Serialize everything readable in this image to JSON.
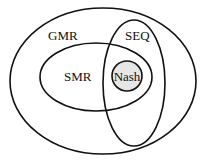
{
  "diagram": {
    "type": "venn",
    "sets": {
      "gmr": {
        "label": "GMR",
        "cx": 103,
        "cy": 81,
        "rx": 93,
        "ry": 73
      },
      "smr": {
        "label": "SMR",
        "cx": 96,
        "cy": 77,
        "rx": 56,
        "ry": 34
      },
      "seq": {
        "label": "SEQ",
        "cx": 134,
        "cy": 83,
        "rx": 31,
        "ry": 63
      },
      "nash": {
        "label": "Nash",
        "cx": 127,
        "cy": 76,
        "r": 15,
        "fill": "#e6e6e6"
      }
    },
    "stroke_color": "#111111"
  }
}
